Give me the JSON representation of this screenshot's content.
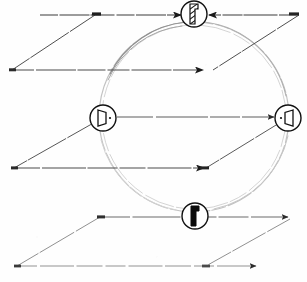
{
  "figure": {
    "title": "Three stacked parallelogram planes intersected by a circle with four symbol markers",
    "background_color": "#fefefe",
    "ink_color": "#1a1a1a",
    "faint_ink_color": "#b4b4b4",
    "mid_ink_color": "#8a8a8a",
    "canvas": {
      "width": 307,
      "height": 282
    }
  },
  "circle": {
    "name": "large-circle",
    "center_x": 194,
    "center_y": 117,
    "radius": 95,
    "stroke": "#bdbdbd",
    "style": "double-stroke faint arc"
  },
  "planes": [
    {
      "name": "top-plane",
      "label": "upper parallelogram",
      "points": "95,15 299,15 212,70 12,70",
      "near_edge_y": 70,
      "far_edge_y": 15
    },
    {
      "name": "middle-plane",
      "label": "middle parallelogram",
      "points": "98,117 297,117 211,168 14,168",
      "near_edge_y": 168,
      "far_edge_y": 117
    },
    {
      "name": "bottom-plane",
      "label": "lower parallelogram",
      "points": "100,217 292,217 206,266 17,266",
      "near_edge_y": 266,
      "far_edge_y": 217
    }
  ],
  "arrows": [
    {
      "name": "arrow-top-left",
      "x1": 40,
      "y1": 15,
      "x2": 183,
      "y2": 15,
      "head": "right"
    },
    {
      "name": "arrow-top-right",
      "x1": 299,
      "y1": 15,
      "x2": 207,
      "y2": 15,
      "head": "left"
    },
    {
      "name": "arrow-top-near",
      "x1": 12,
      "y1": 70,
      "x2": 205,
      "y2": 70,
      "head": "right"
    },
    {
      "name": "arrow-middle-far",
      "x1": 117,
      "y1": 117,
      "x2": 276,
      "y2": 117,
      "head": "right"
    },
    {
      "name": "arrow-middle-near",
      "x1": 14,
      "y1": 168,
      "x2": 206,
      "y2": 168,
      "head": "right"
    },
    {
      "name": "arrow-bottom-far",
      "x1": 100,
      "y1": 217,
      "x2": 290,
      "y2": 217,
      "head": "right"
    },
    {
      "name": "arrow-bottom-near",
      "x1": 17,
      "y1": 266,
      "x2": 258,
      "y2": 266,
      "head": "right"
    }
  ],
  "markers": [
    {
      "name": "marker-top",
      "position": "top",
      "cx": 194,
      "cy": 14,
      "r": 13,
      "symbol": "hatched-tool-icon",
      "symbol_description": "upright stepped block with diagonal hatching",
      "fill": "#ffffff",
      "stroke": "#111111"
    },
    {
      "name": "marker-left",
      "position": "left",
      "cx": 103,
      "cy": 118,
      "r": 13,
      "symbol": "door-left-icon",
      "symbol_description": "slanted quadrilateral with a dot at the right, pointing left",
      "fill": "#ffffff",
      "stroke": "#111111"
    },
    {
      "name": "marker-right",
      "position": "right",
      "cx": 288,
      "cy": 118,
      "r": 13,
      "symbol": "door-right-icon",
      "symbol_description": "slanted quadrilateral with a dot at the left, mirrored",
      "fill": "#ffffff",
      "stroke": "#111111"
    },
    {
      "name": "marker-bottom",
      "position": "bottom",
      "cx": 195,
      "cy": 216,
      "r": 13,
      "symbol": "solid-block-icon",
      "symbol_description": "solid black stepped block",
      "fill": "#ffffff",
      "stroke": "#111111"
    }
  ]
}
